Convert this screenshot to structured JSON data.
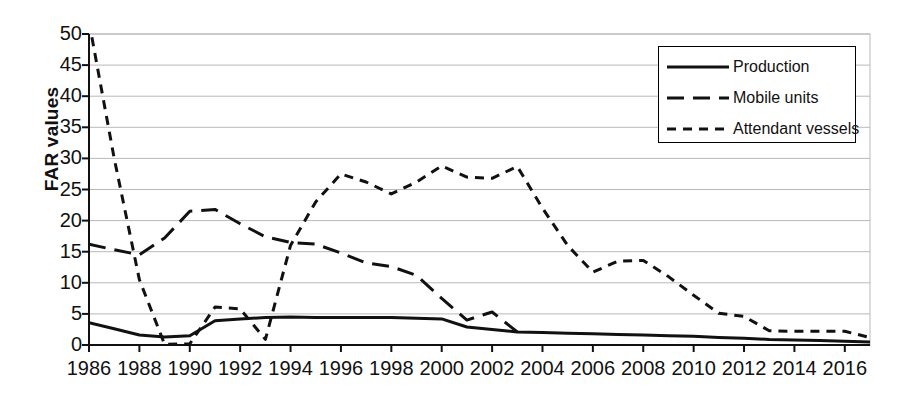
{
  "chart_data": {
    "type": "line",
    "title": "",
    "xlabel": "",
    "ylabel": "FAR values",
    "xlim": [
      1986,
      2017
    ],
    "ylim": [
      0,
      50
    ],
    "yticks": [
      0,
      5,
      10,
      15,
      20,
      25,
      30,
      35,
      40,
      45,
      50
    ],
    "xticks": [
      1986,
      1988,
      1990,
      1992,
      1994,
      1996,
      1998,
      2000,
      2002,
      2004,
      2006,
      2008,
      2010,
      2012,
      2014,
      2016
    ],
    "grid": true,
    "legend_position": "top-right",
    "x": [
      1986,
      1987,
      1988,
      1989,
      1990,
      1991,
      1992,
      1993,
      1994,
      1995,
      1996,
      1997,
      1998,
      1999,
      2000,
      2001,
      2002,
      2003,
      2004,
      2005,
      2006,
      2007,
      2008,
      2009,
      2010,
      2011,
      2012,
      2013,
      2014,
      2015,
      2016,
      2017
    ],
    "series": [
      {
        "name": "Production",
        "style": "solid",
        "values": [
          3.6,
          2.6,
          1.6,
          1.3,
          1.5,
          3.9,
          4.2,
          4.4,
          4.5,
          4.4,
          4.4,
          4.4,
          4.4,
          4.3,
          4.2,
          2.9,
          2.5,
          2.1,
          2.0,
          1.9,
          1.8,
          1.7,
          1.6,
          1.5,
          1.4,
          1.2,
          1.1,
          0.9,
          0.8,
          0.7,
          0.6,
          0.5
        ]
      },
      {
        "name": "Mobile units",
        "style": "long-dash",
        "values": [
          16.2,
          15.3,
          14.5,
          17.2,
          21.5,
          21.8,
          19.5,
          17.4,
          16.5,
          16.2,
          14.8,
          13.2,
          12.6,
          11.2,
          7.5,
          4.0,
          5.3,
          2.1,
          null,
          null,
          null,
          null,
          null,
          null,
          null,
          null,
          null,
          null,
          null,
          null,
          null,
          null
        ]
      },
      {
        "name": "Attendant vessels",
        "style": "short-dash",
        "values": [
          52.0,
          30.0,
          10.5,
          0.1,
          0.2,
          6.1,
          5.8,
          0.9,
          16.0,
          23.0,
          27.5,
          26.2,
          24.3,
          26.2,
          28.8,
          27.0,
          26.8,
          28.7,
          22.0,
          16.0,
          11.7,
          13.5,
          13.6,
          11.0,
          8.0,
          5.1,
          4.6,
          2.3,
          2.2,
          2.2,
          2.2,
          1.2
        ]
      }
    ]
  },
  "axis": {
    "ylabel": "FAR values",
    "ytick_labels": [
      "50",
      "45",
      "40",
      "35",
      "30",
      "25",
      "20",
      "15",
      "10",
      "5",
      "0"
    ],
    "xtick_labels": [
      "1986",
      "1988",
      "1990",
      "1992",
      "1994",
      "1996",
      "1998",
      "2000",
      "2002",
      "2004",
      "2006",
      "2008",
      "2010",
      "2012",
      "2014",
      "2016"
    ]
  },
  "legend": {
    "items": [
      {
        "label": "Production",
        "style": "solid"
      },
      {
        "label": "Mobile units",
        "style": "long-dash"
      },
      {
        "label": "Attendant vessels",
        "style": "short-dash"
      }
    ]
  },
  "colors": {
    "line": "#111111",
    "grid": "#b9b9b9",
    "axis": "#111111",
    "background": "#ffffff"
  }
}
